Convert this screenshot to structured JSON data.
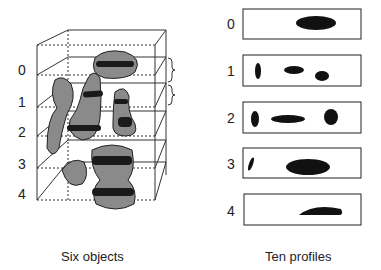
{
  "left": {
    "caption": "Six objects",
    "levels": [
      "0",
      "1",
      "2",
      "3",
      "4"
    ]
  },
  "right": {
    "caption": "Ten profiles",
    "profiles": [
      "0",
      "1",
      "2",
      "3",
      "4"
    ]
  },
  "colors": {
    "object_fill": "#8a8a8a",
    "stripe": "#1a1a1a",
    "line": "#333333"
  }
}
